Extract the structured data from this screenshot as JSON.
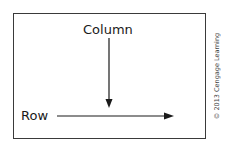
{
  "diagram": {
    "labels": {
      "column": "Column",
      "row": "Row"
    },
    "arrows": [
      {
        "name": "column-arrow",
        "direction": "down"
      },
      {
        "name": "row-arrow",
        "direction": "right"
      }
    ],
    "copyright": "© 2013 Cengage Learning",
    "colors": {
      "stroke": "#1a1a1a",
      "border": "#3a3a3a",
      "background": "#ffffff"
    }
  }
}
